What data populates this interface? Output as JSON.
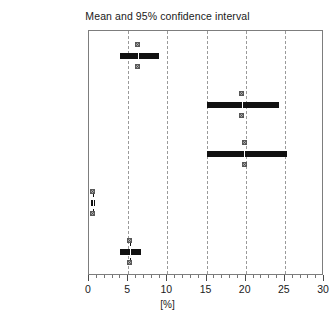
{
  "chart_data": {
    "type": "bar",
    "title": "Mean and 95% confidence interval",
    "xlabel": "[%]",
    "ylabel": "",
    "xlim": [
      0,
      30
    ],
    "xticks": [
      0,
      5,
      10,
      15,
      20,
      25,
      30
    ],
    "xticklabels": [
      "0",
      "5",
      "10",
      "15",
      "20",
      "25",
      "30"
    ],
    "minor_tick_step": 1,
    "grid": "vertical dashed gridlines at 5, 10, 15, 20, 25",
    "gridlines": [
      5,
      10,
      15,
      20,
      25
    ],
    "legend": "none",
    "orientation": "horizontal",
    "categories": [
      "Ovarian cancer",
      "Cervical cancer",
      "Uterine cancer",
      "Breast cancer",
      "Benign disease"
    ],
    "series": [
      {
        "name": "Mean",
        "values": [
          6.2,
          19.5,
          19.8,
          0.5,
          5.2
        ]
      },
      {
        "name": "95% CI lower",
        "values": [
          4.0,
          15.0,
          15.0,
          0.2,
          4.0
        ]
      },
      {
        "name": "95% CI upper",
        "values": [
          9.0,
          24.2,
          25.3,
          0.8,
          6.7
        ]
      }
    ],
    "points": [
      {
        "category": "Ovarian cancer",
        "mean": 6.2,
        "ci_low": 4.0,
        "ci_high": 9.0
      },
      {
        "category": "Cervical cancer",
        "mean": 19.5,
        "ci_low": 15.0,
        "ci_high": 24.2
      },
      {
        "category": "Uterine cancer",
        "mean": 19.8,
        "ci_low": 15.0,
        "ci_high": 25.3
      },
      {
        "category": "Breast cancer",
        "mean": 0.5,
        "ci_low": 0.2,
        "ci_high": 0.8
      },
      {
        "category": "Benign disease",
        "mean": 5.2,
        "ci_low": 4.0,
        "ci_high": 6.7
      }
    ],
    "colors": {
      "bar": "#111111",
      "gridline": "#9a9a9a",
      "frame": "#7d7d7d",
      "text": "#1a1a1a",
      "marker_fill": "#d8d8d8",
      "marker_edge": "#5b5b5b"
    }
  }
}
